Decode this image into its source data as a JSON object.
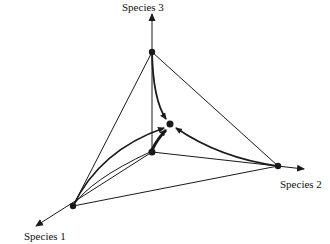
{
  "diagram": {
    "type": "3-species simplex phase portrait",
    "labels": {
      "species1": "Species 1",
      "species2": "Species 2",
      "species3": "Species 3"
    },
    "colors": {
      "line": "#1a1a1a",
      "background": "#ffffff"
    },
    "nodes": [
      {
        "id": "origin",
        "x": 152,
        "y": 152
      },
      {
        "id": "vertex-species-3",
        "x": 152,
        "y": 52
      },
      {
        "id": "vertex-species-1",
        "x": 73,
        "y": 206
      },
      {
        "id": "vertex-species-2",
        "x": 278,
        "y": 166
      },
      {
        "id": "interior-equilibrium",
        "x": 170,
        "y": 124
      }
    ]
  }
}
